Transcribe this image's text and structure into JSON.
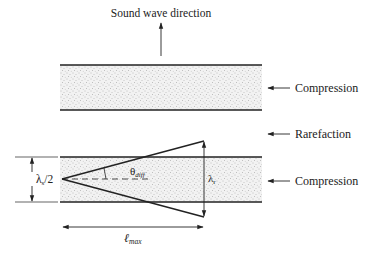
{
  "diagram": {
    "title_label": "Sound wave direction",
    "layers": [
      {
        "name": "Compression",
        "label": "Compression"
      },
      {
        "name": "Rarefaction",
        "label": "Rarefaction"
      },
      {
        "name": "Compression",
        "label": "Compression"
      }
    ],
    "symbols": {
      "half_wavelength_base": "λ",
      "half_wavelength_sub": "s",
      "half_wavelength_suffix": "/2",
      "angle_base": "θ",
      "angle_sub": "diff",
      "wavelength_r_base": "λ",
      "wavelength_r_sub": "r",
      "length_base": "ℓ",
      "length_sub": "max"
    },
    "colors": {
      "line": "#222222",
      "band_fill": "#efefef",
      "stipple": "#8a8a8a"
    }
  }
}
